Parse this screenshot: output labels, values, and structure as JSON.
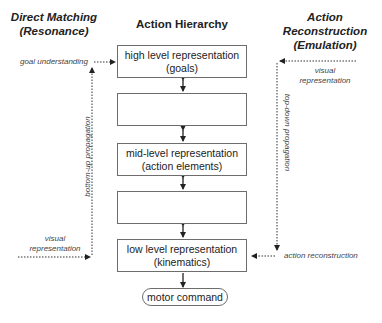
{
  "headers": {
    "left": [
      "Direct Matching",
      "(Resonance)"
    ],
    "center": "Action Hierarchy",
    "right": [
      "Action Reconstruction",
      "(Emulation)"
    ]
  },
  "hierarchy": {
    "boxes": [
      {
        "line1": "high level representation",
        "line2": "(goals)"
      },
      {
        "line1": "",
        "line2": ""
      },
      {
        "line1": "mid-level representation",
        "line2": "(action elements)"
      },
      {
        "line1": "",
        "line2": ""
      },
      {
        "line1": "low level representation",
        "line2": "(kinematics)"
      }
    ],
    "output": "motor command"
  },
  "left_side": {
    "goal_label": "goal understanding",
    "vertical_label": "bottom-up propagation",
    "input_label": [
      "visual",
      "representation"
    ]
  },
  "right_side": {
    "input_label": [
      "visual",
      "representation"
    ],
    "vertical_label": "top-down propagation",
    "output_label": "action reconstruction"
  },
  "colors": {
    "line": "#333333",
    "box_border": "#6d6d6d"
  }
}
